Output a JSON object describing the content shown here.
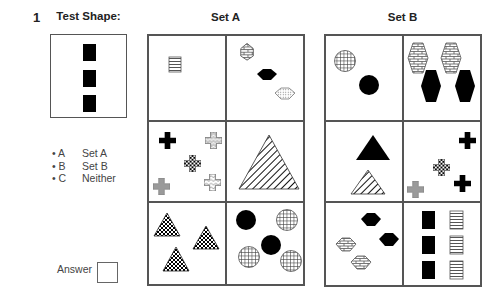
{
  "question": {
    "number": "1",
    "test_shape_heading": "Test Shape:",
    "test_shape": "three black rectangles stacked vertically",
    "set_a_heading": "Set A",
    "set_b_heading": "Set B",
    "options": [
      {
        "letter": "• A",
        "label": "Set A"
      },
      {
        "letter": "• B",
        "label": "Set B"
      },
      {
        "letter": "• C",
        "label": "Neither"
      }
    ],
    "answer_label": "Answer",
    "answer_value": ""
  },
  "set_a": {
    "cells": [
      {
        "position": "top-left",
        "content": "one horizontal-striped rectangle"
      },
      {
        "position": "top-right",
        "content": "brick hexagon, black hexagon, dotted hexagon"
      },
      {
        "position": "middle-left",
        "content": "five crosses: black, white-patterned, checked, grey, scaled"
      },
      {
        "position": "middle-right",
        "content": "one large diagonal-striped triangle"
      },
      {
        "position": "bottom-left",
        "content": "three checkered triangles"
      },
      {
        "position": "bottom-right",
        "content": "two black circles, three grid-hatched circles"
      }
    ]
  },
  "set_b": {
    "cells": [
      {
        "position": "top-left",
        "content": "grid-hatched circle, black circle"
      },
      {
        "position": "top-right",
        "content": "two brick elongated hexagons, two black elongated hexagons"
      },
      {
        "position": "middle-left",
        "content": "black triangle, diagonal-striped triangle"
      },
      {
        "position": "middle-right",
        "content": "two black crosses, checked cross, grey cross"
      },
      {
        "position": "bottom-left",
        "content": "two black hexagons, two brick hexagons"
      },
      {
        "position": "bottom-right",
        "content": "three black rectangles, three horizontal-striped rectangles"
      }
    ]
  },
  "colors": {
    "border": "#555555",
    "fill_black": "#000000",
    "fill_grey": "#9a9a9a",
    "text": "#222222"
  }
}
